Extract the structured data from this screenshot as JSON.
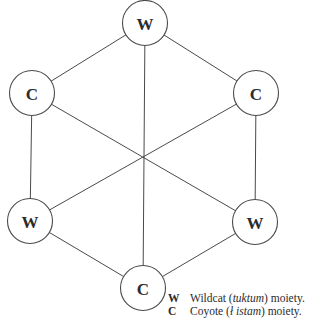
{
  "diagram": {
    "type": "hexagonal-kinship-diagram",
    "center": {
      "x": 144,
      "y": 157
    },
    "node_radius": 22.5,
    "nodes": [
      {
        "id": "top",
        "label": "W",
        "x": 145,
        "y": 23
      },
      {
        "id": "upper-right",
        "label": "C",
        "x": 256,
        "y": 93
      },
      {
        "id": "lower-right",
        "label": "W",
        "x": 255,
        "y": 222
      },
      {
        "id": "bottom",
        "label": "C",
        "x": 143,
        "y": 288
      },
      {
        "id": "lower-left",
        "label": "W",
        "x": 30,
        "y": 221
      },
      {
        "id": "upper-left",
        "label": "C",
        "x": 32,
        "y": 93
      }
    ],
    "perimeter_edges": [
      [
        "top",
        "upper-right"
      ],
      [
        "upper-right",
        "lower-right"
      ],
      [
        "lower-right",
        "bottom"
      ],
      [
        "bottom",
        "lower-left"
      ],
      [
        "lower-left",
        "upper-left"
      ],
      [
        "upper-left",
        "top"
      ]
    ],
    "diagonal_edges": [
      [
        "top",
        "bottom"
      ],
      [
        "upper-right",
        "lower-left"
      ],
      [
        "upper-left",
        "lower-right"
      ]
    ]
  },
  "legend": {
    "items": [
      {
        "key": "W",
        "name": "Wildcat",
        "native_term": "tuktum",
        "suffix": "moiety."
      },
      {
        "key": "C",
        "name": "Coyote",
        "native_term": "ł istam",
        "suffix": "moiety."
      }
    ]
  }
}
